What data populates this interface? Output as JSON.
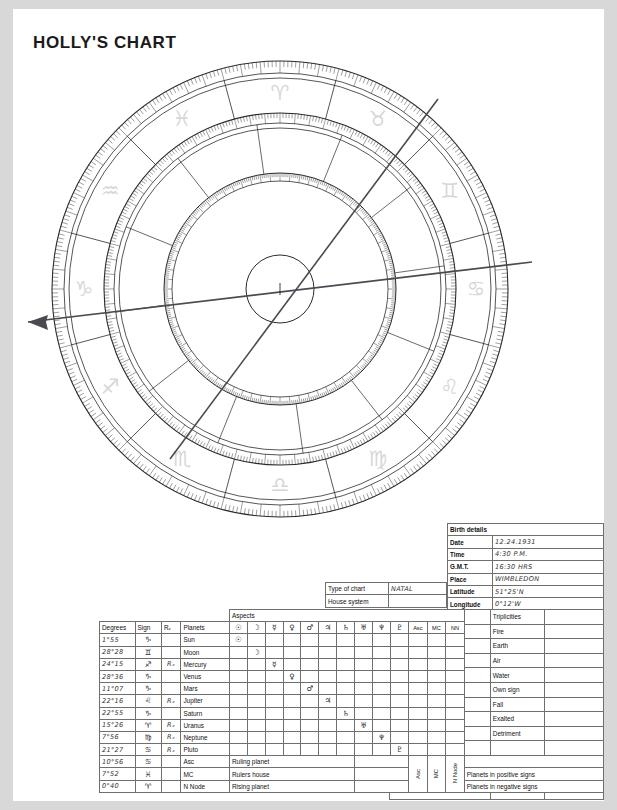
{
  "page": {
    "title": "HOLLY'S CHART"
  },
  "wheel": {
    "zodiac_order": [
      "Aries",
      "Pisces",
      "Aquarius",
      "Capricorn",
      "Sagittarius",
      "Scorpio",
      "Libra",
      "Virgo",
      "Leo",
      "Cancer",
      "Gemini",
      "Taurus"
    ],
    "zodiac_glyphs": [
      "♈",
      "♓",
      "♒",
      "♑",
      "♐",
      "♏",
      "♎",
      "♍",
      "♌",
      "♋",
      "♊",
      "♉"
    ],
    "axis_note": "Ascendant axis arrow points left",
    "glyph_color": "#d7d7d7",
    "line_color": "#2b2b2b"
  },
  "birth_details": {
    "header": "Birth details",
    "rows": [
      {
        "label": "Date",
        "value": "12.24.1931"
      },
      {
        "label": "Time",
        "value": "4:30 P.M."
      },
      {
        "label": "G.M.T.",
        "value": "16:30 HRS"
      },
      {
        "label": "Place",
        "value": "WIMBLEDON"
      },
      {
        "label": "Latitude",
        "value": "51°25'N"
      },
      {
        "label": "Longitude",
        "value": "0°12'W"
      }
    ]
  },
  "chart_type": {
    "rows": [
      {
        "label": "Type of chart",
        "value": "NATAL"
      },
      {
        "label": "House system",
        "value": ""
      }
    ]
  },
  "quadruplicities": {
    "header_left": "Quadruplicities",
    "header_right": "Triplicities",
    "left_items": [
      "Cardinal",
      "Fixed",
      "Mutable",
      "Angular",
      "",
      "Mutual reception",
      "",
      "NOTES"
    ],
    "right_items": [
      "Fire",
      "Earth",
      "Air",
      "Water",
      "Own sign",
      "Fall",
      "Exalted",
      "Detriment"
    ]
  },
  "planets_table": {
    "headers": {
      "degrees": "Degrees",
      "sign": "Sign",
      "rx": "Rₓ",
      "planets": "Planets",
      "aspects": "Aspects",
      "asc": "Asc",
      "mc": "MC",
      "nn": "NN"
    },
    "aspect_columns": [
      "☉",
      "☽",
      "☿",
      "♀",
      "♂",
      "♃",
      "♄",
      "♅",
      "♆",
      "♇"
    ],
    "rows": [
      {
        "degrees": "1°55",
        "sign": "♑",
        "rx": "",
        "planet": "Sun",
        "glyph": "☉",
        "col": 0
      },
      {
        "degrees": "28°28",
        "sign": "♊",
        "rx": "",
        "planet": "Moon",
        "glyph": "☽",
        "col": 1
      },
      {
        "degrees": "24°15",
        "sign": "♐",
        "rx": "Rₓ",
        "planet": "Mercury",
        "glyph": "☿",
        "col": 2
      },
      {
        "degrees": "28°36",
        "sign": "♑",
        "rx": "",
        "planet": "Venus",
        "glyph": "♀",
        "col": 3
      },
      {
        "degrees": "11°07",
        "sign": "♑",
        "rx": "",
        "planet": "Mars",
        "glyph": "♂",
        "col": 4
      },
      {
        "degrees": "22°16",
        "sign": "♌",
        "rx": "Rₓ",
        "planet": "Jupiter",
        "glyph": "♃",
        "col": 5
      },
      {
        "degrees": "22°55",
        "sign": "♑",
        "rx": "",
        "planet": "Saturn",
        "glyph": "♄",
        "col": 6
      },
      {
        "degrees": "15°26",
        "sign": "♈",
        "rx": "Rₓ",
        "planet": "Uranus",
        "glyph": "♅",
        "col": 7
      },
      {
        "degrees": "7°56",
        "sign": "♍",
        "rx": "Rₓ",
        "planet": "Neptune",
        "glyph": "♆",
        "col": 8
      },
      {
        "degrees": "21°27",
        "sign": "♋",
        "rx": "Rₓ",
        "planet": "Pluto",
        "glyph": "♇",
        "col": 9
      }
    ],
    "angle_rows": [
      {
        "degrees": "10°56",
        "sign": "♋",
        "rx": "",
        "planet": "Asc",
        "note": "Ruling planet"
      },
      {
        "degrees": "7°52",
        "sign": "♓",
        "rx": "",
        "planet": "MC",
        "note": "Rulers house"
      },
      {
        "degrees": "0°40",
        "sign": "♈",
        "rx": "",
        "planet": "N Node",
        "note": "Rising planet"
      }
    ],
    "rotated_labels": [
      "Asc",
      "MC",
      "N Node"
    ],
    "sign_rows": [
      "Planets in positive signs",
      "Planets in negative signs"
    ]
  }
}
